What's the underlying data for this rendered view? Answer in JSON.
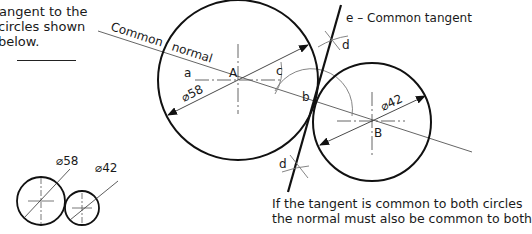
{
  "intro_text": {
    "lines": [
      "tangent to the",
      "circles shown",
      "below."
    ]
  },
  "main_diagram": {
    "normal_label": "Common normal",
    "normal_label_part1": "Common",
    "normal_label_part2": "normal",
    "tangent_label": "e – Common tangent",
    "circle_a": {
      "label": "A",
      "diameter_label": "⌀58",
      "cx": 238,
      "cy": 80,
      "r": 80
    },
    "circle_b": {
      "label": "B",
      "diameter_label": "⌀42",
      "cx": 372,
      "cy": 122,
      "r": 59
    },
    "point_labels": {
      "a": "a",
      "b": "b",
      "c": "c",
      "d_top": "d",
      "d_bottom": "d"
    }
  },
  "small_diagram": {
    "circle_1": {
      "diameter_label": "⌀58",
      "cx": 41,
      "cy": 201,
      "r": 24
    },
    "circle_2": {
      "diameter_label": "⌀42",
      "cx": 82,
      "cy": 208,
      "r": 17
    }
  },
  "caption": {
    "lines": [
      "If the tangent is common to both circles",
      "the normal must also be common to both"
    ]
  },
  "colors": {
    "line": "#111111",
    "thin_line": "#555555",
    "text": "#1a1a1a",
    "background": "#ffffff"
  }
}
